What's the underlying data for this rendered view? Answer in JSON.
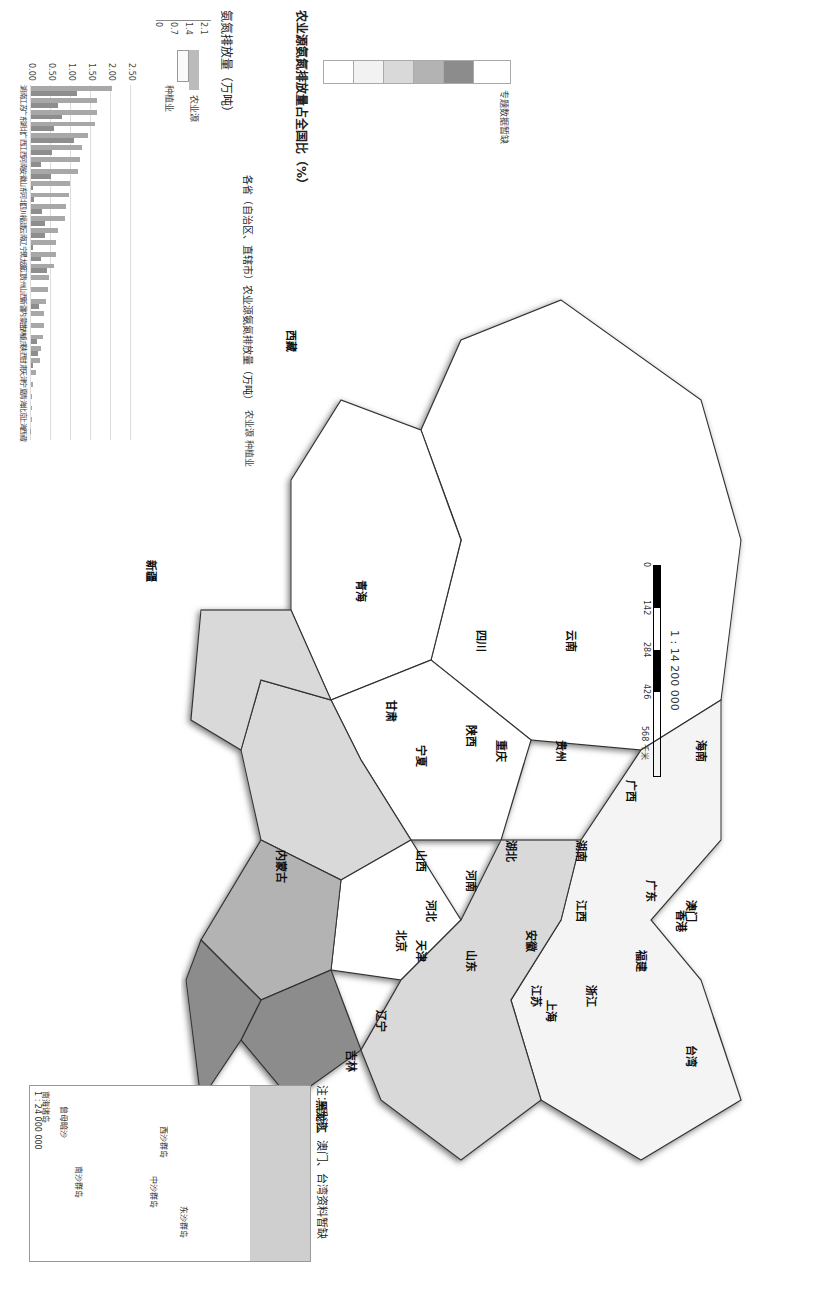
{
  "map": {
    "scale_text": "1 : 14 200 000",
    "scale_ticks": [
      "0",
      "142",
      "284",
      "426",
      "568 千米"
    ],
    "note": "注：香港、澳门、台湾资料暂缺",
    "inset_title": "南海诸岛",
    "inset_scale": "1 : 24 000 000",
    "inset_labels": [
      "广西",
      "海南",
      "广东",
      "澳门",
      "香港",
      "福建",
      "台湾",
      "东沙群岛",
      "西沙群岛",
      "中沙群岛",
      "黄岩岛",
      "南沙群岛",
      "曾母暗沙"
    ],
    "islands": [
      "钓鱼岛",
      "赤尾屿"
    ],
    "provinces": [
      {
        "name": "新疆",
        "class": "<1"
      },
      {
        "name": "西藏",
        "class": "<1"
      },
      {
        "name": "青海",
        "class": "<1"
      },
      {
        "name": "甘肃",
        "class": "<1"
      },
      {
        "name": "宁夏",
        "class": "<1"
      },
      {
        "name": "内蒙古",
        "class": "<1"
      },
      {
        "name": "陕西",
        "class": "<1"
      },
      {
        "name": "四川",
        "class": "2~5"
      },
      {
        "name": "云南",
        "class": "2~5"
      },
      {
        "name": "贵州",
        "class": "<1"
      },
      {
        "name": "重庆",
        "class": "<1"
      },
      {
        "name": "广西",
        "class": "5~7"
      },
      {
        "name": "海南",
        "class": "<1"
      },
      {
        "name": "湖南",
        "class": ">7"
      },
      {
        "name": "湖北",
        "class": ">7"
      },
      {
        "name": "广东",
        "class": ">7"
      },
      {
        "name": "澳门",
        "class": "no-data"
      },
      {
        "name": "香港",
        "class": "no-data"
      },
      {
        "name": "江西",
        "class": "5~7"
      },
      {
        "name": "河南",
        "class": "5~7"
      },
      {
        "name": "山西",
        "class": "2~5"
      },
      {
        "name": "河北",
        "class": "2~5"
      },
      {
        "name": "北京",
        "class": "<1"
      },
      {
        "name": "天津",
        "class": "<1"
      },
      {
        "name": "山东",
        "class": "2~5"
      },
      {
        "name": "安徽",
        "class": "5~7"
      },
      {
        "name": "江苏",
        "class": ">7"
      },
      {
        "name": "上海",
        "class": "<1"
      },
      {
        "name": "浙江",
        "class": "2~5"
      },
      {
        "name": "福建",
        "class": "2~5"
      },
      {
        "name": "台湾",
        "class": "no-data"
      },
      {
        "name": "辽宁",
        "class": "2~5"
      },
      {
        "name": "吉林",
        "class": "<1"
      },
      {
        "name": "黑龙江",
        "class": "2~5"
      }
    ]
  },
  "legend": {
    "title": "农业源氨氮排放量占全国比（%）",
    "items": [
      {
        "label": "<1",
        "color": "#ffffff"
      },
      {
        "label": "1~2",
        "color": "#f2f2f2"
      },
      {
        "label": "2~5",
        "color": "#d9d9d9"
      },
      {
        "label": "5~7",
        "color": "#b3b3b3"
      },
      {
        "label": ">7",
        "color": "#8c8c8c"
      },
      {
        "label": "专题数据暂缺",
        "color": "#ffffff"
      }
    ],
    "mini_chart_title": "氨氮排放量（万吨）",
    "mini_ticks": [
      "0",
      "0.7",
      "1.4",
      "2.1"
    ],
    "mini_series": [
      "农业源",
      "种植业"
    ]
  },
  "chart_data": {
    "type": "bar",
    "title": "各省（自治区、直辖市）农业源氨氮排放量（万吨）",
    "legend": [
      "农业源",
      "种植业"
    ],
    "xlabel": "",
    "ylabel": "",
    "ylim": [
      0,
      2.5
    ],
    "ticks": [
      "0.00",
      "0.50",
      "1.00",
      "1.50",
      "2.00",
      "2.50"
    ],
    "grid": true,
    "categories": [
      "湖南",
      "江苏",
      "广东",
      "湖北",
      "广西",
      "江西",
      "河南",
      "安徽",
      "山东",
      "河北",
      "四川",
      "福建",
      "云南",
      "辽宁",
      "黑龙江",
      "浙江",
      "贵州",
      "山西",
      "新疆",
      "内蒙古",
      "吉林",
      "重庆",
      "陕西",
      "甘肃",
      "天津",
      "宁夏",
      "青海",
      "北京",
      "上海",
      "西藏"
    ],
    "series": [
      {
        "name": "农业源",
        "values": [
          2.03,
          1.65,
          1.65,
          1.6,
          1.42,
          1.28,
          1.22,
          1.18,
          0.98,
          0.95,
          0.87,
          0.84,
          0.67,
          0.63,
          0.62,
          0.58,
          0.46,
          0.42,
          0.38,
          0.32,
          0.32,
          0.29,
          0.24,
          0.22,
          0.12,
          0.06,
          0.03,
          0.02,
          0.02,
          0.01
        ]
      },
      {
        "name": "种植业",
        "values": [
          1.15,
          0.68,
          0.78,
          0.58,
          1.07,
          0.52,
          0.24,
          0.5,
          0.05,
          0.08,
          0.28,
          0.35,
          0.35,
          0.05,
          0.25,
          0.4,
          0.0,
          0.0,
          0.2,
          0.0,
          0.0,
          0.15,
          0.18,
          0.05,
          0.0,
          0.0,
          0.0,
          0.0,
          0.0,
          0.0
        ]
      }
    ]
  }
}
